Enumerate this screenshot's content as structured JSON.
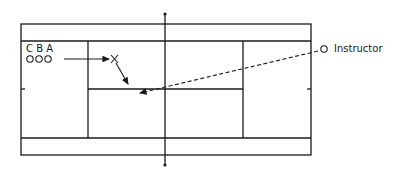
{
  "diagram": {
    "type": "tennis-court-drill",
    "players": {
      "labels": [
        "C",
        "B",
        "A"
      ],
      "label_text": "C B A",
      "markers_text": "OOO"
    },
    "target_marker": "X",
    "instructor": {
      "marker": "O",
      "label": "Instructor"
    },
    "colors": {
      "line": "#1a1a1a",
      "background": "#ffffff"
    }
  }
}
